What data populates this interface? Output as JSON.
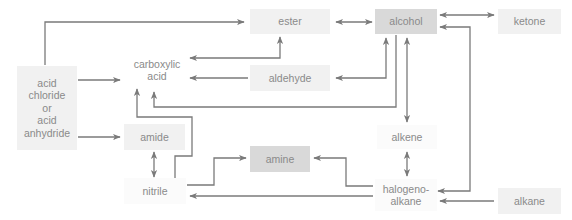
{
  "colors": {
    "arrow": "#7a7a7a",
    "box_light": "#f1f1f1",
    "box_dark": "#d9d9d9",
    "text": "#8a8a8a"
  },
  "nodes": {
    "ester": {
      "label": "ester"
    },
    "alcohol": {
      "label": "alcohol"
    },
    "ketone": {
      "label": "ketone"
    },
    "carboxylic_acid": {
      "label": "carboxylic\nacid"
    },
    "aldehyde": {
      "label": "aldehyde"
    },
    "acid_chloride": {
      "label": "acid\nchloride\nor\nacid\nanhydride"
    },
    "amide": {
      "label": "amide"
    },
    "alkene": {
      "label": "alkene"
    },
    "amine": {
      "label": "amine"
    },
    "nitrile": {
      "label": "nitrile"
    },
    "halogenoalkane": {
      "label": "halogeno-\nalkane"
    },
    "alkane": {
      "label": "alkane"
    }
  },
  "edges": [
    {
      "from": "acid chloride or acid anhydride",
      "to": "ester",
      "type": "one-way"
    },
    {
      "from": "acid chloride or acid anhydride",
      "to": "carboxylic acid",
      "type": "one-way"
    },
    {
      "from": "acid chloride or acid anhydride",
      "to": "amide",
      "type": "one-way"
    },
    {
      "from": "ester",
      "to": "alcohol",
      "type": "two-way"
    },
    {
      "from": "alcohol",
      "to": "ketone",
      "type": "two-way"
    },
    {
      "from": "carboxylic acid",
      "to": "ester",
      "type": "two-way"
    },
    {
      "from": "aldehyde",
      "to": "carboxylic acid",
      "type": "one-way"
    },
    {
      "from": "aldehyde",
      "to": "alcohol",
      "type": "two-way"
    },
    {
      "from": "alcohol",
      "to": "carboxylic acid",
      "type": "one-way"
    },
    {
      "from": "alcohol",
      "to": "alkene",
      "type": "one-way"
    },
    {
      "from": "halogenoalkane",
      "to": "alcohol",
      "type": "two-way"
    },
    {
      "from": "nitrile",
      "to": "carboxylic acid",
      "type": "one-way"
    },
    {
      "from": "amide",
      "to": "nitrile",
      "type": "two-way"
    },
    {
      "from": "nitrile",
      "to": "amine",
      "type": "one-way"
    },
    {
      "from": "halogenoalkane",
      "to": "amine",
      "type": "one-way"
    },
    {
      "from": "halogenoalkane",
      "to": "nitrile",
      "type": "one-way"
    },
    {
      "from": "alkene",
      "to": "halogenoalkane",
      "type": "two-way"
    },
    {
      "from": "alkane",
      "to": "halogenoalkane",
      "type": "one-way"
    }
  ]
}
